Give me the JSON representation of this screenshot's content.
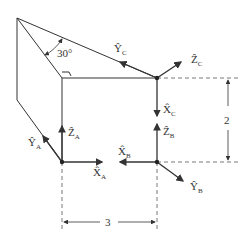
{
  "diagram": {
    "angle_label": "30°",
    "labels": {
      "YC": {
        "main": "Ŷ",
        "sub": "C"
      },
      "ZC": {
        "main": "Ẑ",
        "sub": "C"
      },
      "XC": {
        "main": "X̂",
        "sub": "C"
      },
      "ZB": {
        "main": "Ẑ",
        "sub": "B"
      },
      "XB": {
        "main": "X̂",
        "sub": "B"
      },
      "YB": {
        "main": "Ŷ",
        "sub": "B"
      },
      "YA": {
        "main": "Ŷ",
        "sub": "A"
      },
      "ZA": {
        "main": "Ẑ",
        "sub": "A"
      },
      "XA": {
        "main": "X̂",
        "sub": "A"
      }
    },
    "dimensions": {
      "height": "2",
      "width": "3"
    },
    "colors": {
      "line": "#333333",
      "background": "#ffffff"
    }
  }
}
